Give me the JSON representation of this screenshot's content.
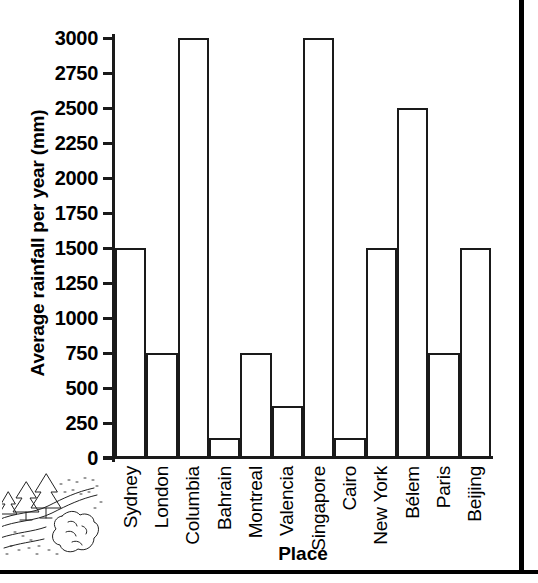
{
  "chart_data": {
    "type": "bar",
    "title": "",
    "xlabel": "Place",
    "ylabel": "Average rainfall per year (mm)",
    "categories": [
      "Sydney",
      "London",
      "Columbia",
      "Bahrain",
      "Montreal",
      "Valencia",
      "Singapore",
      "Cairo",
      "New York",
      "Bélem",
      "Paris",
      "Beijing"
    ],
    "values": [
      1500,
      750,
      3000,
      140,
      750,
      370,
      3000,
      140,
      1500,
      2500,
      750,
      1500
    ],
    "ylim": [
      0,
      3000
    ],
    "yticks": [
      0,
      250,
      500,
      750,
      1000,
      1250,
      1500,
      1750,
      2000,
      2250,
      2500,
      2750,
      3000
    ],
    "ytick_labels": [
      "0",
      "250",
      "500",
      "750",
      "1000",
      "1250",
      "1500",
      "1750",
      "2000",
      "2250",
      "2500",
      "2750",
      "3000"
    ],
    "grid": false,
    "legend": false,
    "bar_fill": "#ffffff",
    "bar_edge": "#1a1a1a"
  },
  "decoration": {
    "name": "trees-river-rock-illustration",
    "description": "line drawing of pine trees beside a winding river with a rock"
  },
  "frame": {
    "border_color": "#000000"
  }
}
